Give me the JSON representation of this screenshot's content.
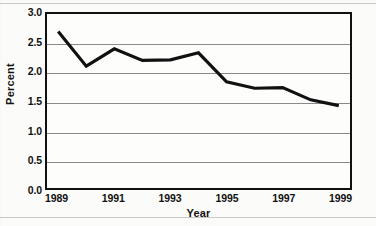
{
  "chart_data": {
    "type": "line",
    "title": "",
    "xlabel": "Year",
    "ylabel": "Percent",
    "x": [
      1989,
      1990,
      1991,
      1992,
      1993,
      1994,
      1995,
      1996,
      1997,
      1998,
      1999
    ],
    "values": [
      2.7,
      2.1,
      2.4,
      2.2,
      2.21,
      2.33,
      1.83,
      1.72,
      1.73,
      1.52,
      1.42
    ],
    "series": [
      {
        "name": "Percent",
        "values": [
          2.7,
          2.1,
          2.4,
          2.2,
          2.21,
          2.33,
          1.83,
          1.72,
          1.73,
          1.52,
          1.42
        ]
      }
    ],
    "xlim": [
      1988.6,
      1999.4
    ],
    "ylim": [
      0.0,
      3.0
    ],
    "y_ticks": [
      0.0,
      0.5,
      1.0,
      1.5,
      2.0,
      2.5,
      3.0
    ],
    "y_tick_labels": [
      "0.0",
      "0.5",
      "1.0",
      "1.5",
      "2.0",
      "2.5",
      "3.0"
    ],
    "x_ticks": [
      1989,
      1991,
      1993,
      1995,
      1997,
      1999
    ],
    "x_tick_labels": [
      "1989",
      "1991",
      "1993",
      "1995",
      "1997",
      "1999"
    ],
    "grid": "horizontal",
    "legend": "none",
    "line_color": "#111111",
    "line_width": 3.2,
    "plot_border_color": "#111111",
    "gridline_color": "#8a8a8a",
    "background_color": "#fbfbfa"
  },
  "axis": {
    "y_title": "Percent",
    "x_title": "Year"
  }
}
